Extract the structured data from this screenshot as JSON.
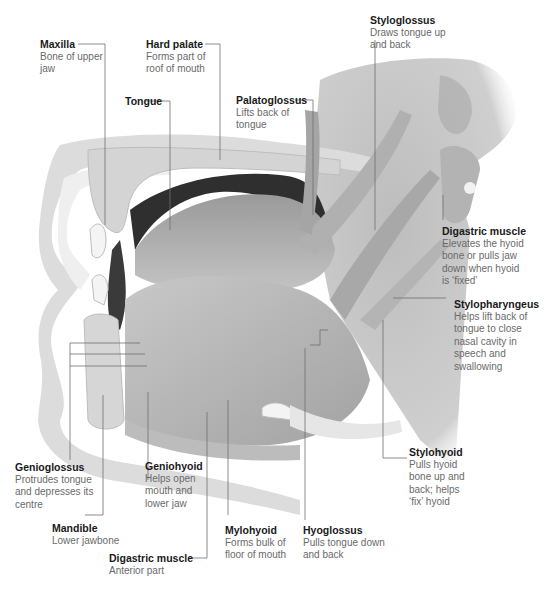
{
  "diagram": {
    "type": "anatomical-illustration",
    "colors": {
      "background": "#ffffff",
      "muscle": "#b9b9b9",
      "muscle_dark": "#8f8f8f",
      "bone": "#d9d9d9",
      "cavity": "#3a3a3a",
      "leader_line": "#6e6e6e",
      "title_text": "#1a1a1a",
      "desc_text": "#6a6a6a"
    }
  },
  "labels": [
    {
      "id": "maxilla",
      "title": "Maxilla",
      "desc": "Bone of upper\njaw"
    },
    {
      "id": "hard-palate",
      "title": "Hard palate",
      "desc": "Forms part of\nroof of mouth"
    },
    {
      "id": "tongue",
      "title": "Tongue",
      "desc": ""
    },
    {
      "id": "palatoglossus",
      "title": "Palatoglossus",
      "desc": "Lifts back of\ntongue"
    },
    {
      "id": "styloglossus",
      "title": "Styloglossus",
      "desc": "Draws tongue up\nand back"
    },
    {
      "id": "digastric-posterior",
      "title": "Digastric muscle",
      "desc": "Elevates the hyoid\nbone or pulls jaw\ndown when hyoid\nis ‘fixed’"
    },
    {
      "id": "stylopharyngeus",
      "title": "Stylopharyngeus",
      "desc": "Helps lift back of\ntongue to close\nnasal cavity in\nspeech and\nswallowing"
    },
    {
      "id": "stylohyoid",
      "title": "Stylohyoid",
      "desc": "Pulls hyoid\nbone up and\nback; helps\n‘fix’ hyoid"
    },
    {
      "id": "genioglossus",
      "title": "Genioglossus",
      "desc": "Protrudes tongue\nand depresses its\ncentre"
    },
    {
      "id": "geniohyoid",
      "title": "Geniohyoid",
      "desc": "Helps open\nmouth and\nlower jaw"
    },
    {
      "id": "mandible",
      "title": "Mandible",
      "desc": "Lower jawbone"
    },
    {
      "id": "mylohyoid",
      "title": "Mylohyoid",
      "desc": "Forms bulk of\nfloor of mouth"
    },
    {
      "id": "hyoglossus",
      "title": "Hyoglossus",
      "desc": "Pulls tongue down\nand back"
    },
    {
      "id": "digastric-anterior",
      "title": "Digastric muscle",
      "desc": "Anterior part"
    }
  ]
}
